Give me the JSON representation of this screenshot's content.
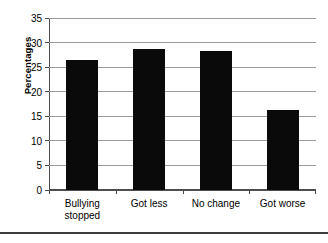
{
  "chart_data": {
    "type": "bar",
    "title": "",
    "xlabel": "",
    "ylabel": "Percentages",
    "categories": [
      "Bullying stopped",
      "Got less",
      "No change",
      "Got worse"
    ],
    "category_lines": [
      [
        "Bullying",
        "stopped"
      ],
      [
        "Got less"
      ],
      [
        "No change"
      ],
      [
        "Got worse"
      ]
    ],
    "values": [
      26.5,
      28.7,
      28.2,
      16.3
    ],
    "ylim": [
      0,
      35
    ],
    "yticks": [
      0,
      5,
      10,
      15,
      20,
      25,
      30,
      35
    ],
    "ytick_labels": [
      "0",
      "5",
      "10",
      "15",
      "20",
      "25",
      "30",
      "35"
    ],
    "grid": "horizontal",
    "legend": "none",
    "bar_color": "#0a0a0a",
    "gridline_color": "#9a9a9a",
    "axis_color": "#4d4d4d",
    "background": "#ffffff"
  }
}
